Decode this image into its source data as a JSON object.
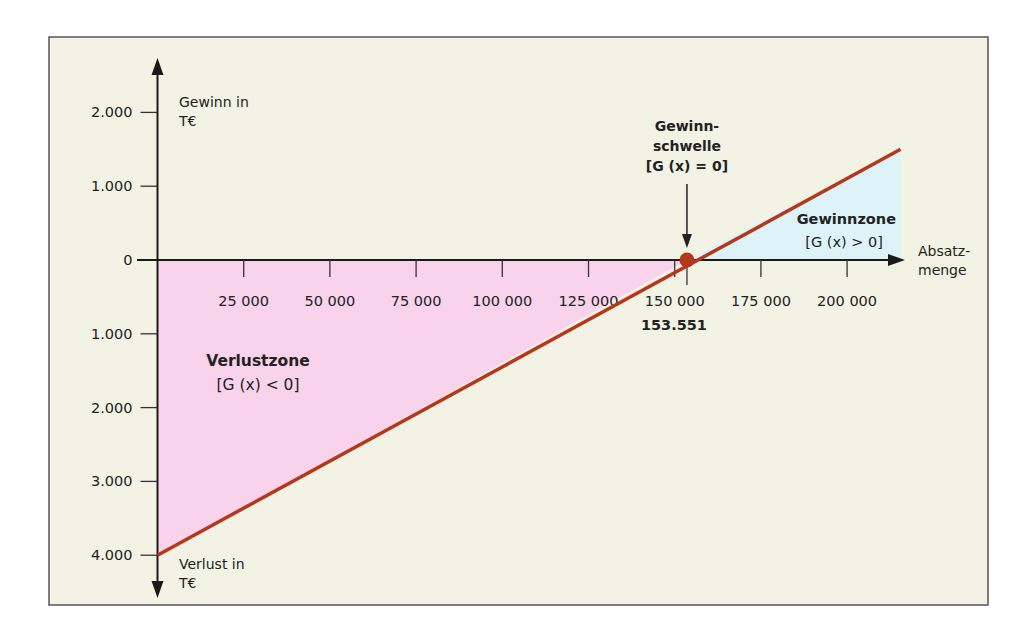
{
  "chart_data": {
    "type": "line",
    "title": "",
    "xlabel": "Absatzmenge",
    "ylabel_top": "Gewinn in T€",
    "ylabel_bottom": "Verlust in T€",
    "x_ticks": [
      {
        "value": 25000,
        "label": "25 000"
      },
      {
        "value": 50000,
        "label": "50 000"
      },
      {
        "value": 75000,
        "label": "75 000"
      },
      {
        "value": 100000,
        "label": "100 000"
      },
      {
        "value": 125000,
        "label": "125 000"
      },
      {
        "value": 150000,
        "label": "150 000"
      },
      {
        "value": 175000,
        "label": "175 000"
      },
      {
        "value": 200000,
        "label": "200 000"
      }
    ],
    "y_ticks": [
      {
        "value": 2000,
        "label": "2.000"
      },
      {
        "value": 1000,
        "label": "1.000"
      },
      {
        "value": 0,
        "label": "0"
      },
      {
        "value": -1000,
        "label": "1.000"
      },
      {
        "value": -2000,
        "label": "2.000"
      },
      {
        "value": -3000,
        "label": "3.000"
      },
      {
        "value": -4000,
        "label": "4.000"
      }
    ],
    "xlim": [
      0,
      220000
    ],
    "ylim": [
      -4400,
      2700
    ],
    "series": [
      {
        "name": "G(x)",
        "x": [
          0,
          153551,
          215500
        ],
        "y": [
          -4000,
          0,
          1500
        ],
        "color": "#b5381c"
      }
    ],
    "breakeven": {
      "x": 153551,
      "label": "153.551",
      "annotation_lines": [
        "Gewinn-",
        "schwelle",
        "[G (x) = 0]"
      ]
    },
    "zones": {
      "loss": {
        "title": "Verlustzone",
        "formula": "[G (x) < 0]",
        "color": "#f9d3ec"
      },
      "profit": {
        "title": "Gewinnzone",
        "formula": "[G (x) > 0]",
        "color": "#ddf3f8"
      }
    },
    "xlabel_lines": [
      "Absatz-",
      "menge"
    ],
    "ylabel_top_lines": [
      "Gewinn in",
      "T€"
    ],
    "ylabel_bottom_lines": [
      "Verlust in",
      "T€"
    ],
    "grid": false,
    "legend": "none"
  },
  "colors": {
    "background": "#f3f3e5",
    "frame": "#555555",
    "axis": "#1a1a1a",
    "line": "#b5381c",
    "loss_fill": "#f9d3ec",
    "profit_fill": "#ddf3f8"
  }
}
